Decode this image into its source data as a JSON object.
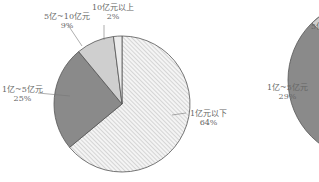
{
  "chart_data": [
    {
      "type": "pie",
      "title": "",
      "slices": [
        {
          "label": "1亿元以下",
          "value": 64,
          "pct_text": "64%",
          "fill": "hatch"
        },
        {
          "label": "1亿~5亿元",
          "value": 25,
          "pct_text": "25%",
          "fill": "#8a8a8a"
        },
        {
          "label": "5亿~10亿元",
          "value": 9,
          "pct_text": "9%",
          "fill": "#cfcfcf"
        },
        {
          "label": "10亿元以上",
          "value": 2,
          "pct_text": "2%",
          "fill": "#ececec"
        }
      ],
      "start_angle": "12 o'clock, clockwise",
      "legend": "none (leader-line labels)"
    },
    {
      "type": "pie",
      "title": "",
      "partial": true,
      "slices": [
        {
          "label": "1亿~5亿元",
          "value": 29,
          "pct_text": "29%",
          "fill": "#8a8a8a"
        },
        {
          "label": "5亿~10亿元",
          "value": null,
          "pct_text": "",
          "fill": "#cfcfcf"
        }
      ]
    }
  ],
  "labels": {
    "l1": "1亿元以下",
    "l1p": "64%",
    "l2": "1亿~5亿元",
    "l2p": "25%",
    "l3": "5亿~10亿元",
    "l3p": "9%",
    "l4": "10亿元以上",
    "l4p": "2%",
    "r1": "1亿~5亿元",
    "r1p": "29%",
    "r2": "5亿"
  }
}
